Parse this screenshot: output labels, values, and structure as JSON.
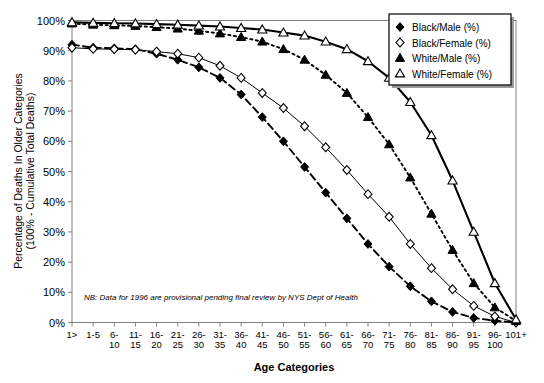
{
  "chart_data": {
    "type": "line",
    "title": "",
    "xlabel": "Age Categories",
    "ylabel": "Percentage of Deaths In Older Categories (100% - Cumulative Total Deaths)",
    "ylabel_line1": "Percentage of Deaths In Older Categories",
    "ylabel_line2": "(100% - Cumulative Total Deaths)",
    "ylim": [
      0,
      100
    ],
    "yticks": [
      0,
      10,
      20,
      30,
      40,
      50,
      60,
      70,
      80,
      90,
      100
    ],
    "ytick_labels": [
      "0%",
      "10%",
      "20%",
      "30%",
      "40%",
      "50%",
      "60%",
      "70%",
      "80%",
      "90%",
      "100%"
    ],
    "grid": false,
    "legend_position": "top-right",
    "annotation": "NB: Data for 1996 are provisional pending final review by NYS Dept of Health",
    "categories": [
      "1>",
      "1-5",
      "6-10",
      "11-15",
      "16-20",
      "21-25",
      "26-30",
      "31-35",
      "36-40",
      "41-45",
      "46-50",
      "51-55",
      "56-60",
      "61-65",
      "66-70",
      "71-75",
      "76-80",
      "81-85",
      "86-90",
      "91-95",
      "96-100",
      "101+"
    ],
    "category_lines": [
      [
        "1>",
        ""
      ],
      [
        "1-5",
        ""
      ],
      [
        "6-",
        "10"
      ],
      [
        "11-",
        "15"
      ],
      [
        "16-",
        "20"
      ],
      [
        "21-",
        "25"
      ],
      [
        "26-",
        "30"
      ],
      [
        "31-",
        "35"
      ],
      [
        "36-",
        "40"
      ],
      [
        "41-",
        "45"
      ],
      [
        "46-",
        "50"
      ],
      [
        "51-",
        "55"
      ],
      [
        "56-",
        "60"
      ],
      [
        "61-",
        "65"
      ],
      [
        "66-",
        "70"
      ],
      [
        "71-",
        "75"
      ],
      [
        "76-",
        "80"
      ],
      [
        "81-",
        "85"
      ],
      [
        "86-",
        "90"
      ],
      [
        "91-",
        "95"
      ],
      [
        "96-",
        "100"
      ],
      [
        "101+",
        ""
      ]
    ],
    "series": [
      {
        "name": "Black/Male (%)",
        "marker": "filled-diamond",
        "line_style": "dashed",
        "color": "#000000",
        "values": [
          92.0,
          91.0,
          90.8,
          90.5,
          89.0,
          87.0,
          84.5,
          81.0,
          75.5,
          68.0,
          60.0,
          51.5,
          43.0,
          34.5,
          26.0,
          18.5,
          12.0,
          7.0,
          3.5,
          1.5,
          0.6,
          0.0
        ]
      },
      {
        "name": "Black/Female (%)",
        "marker": "open-diamond",
        "line_style": "solid-thin",
        "color": "#000000",
        "values": [
          91.0,
          90.6,
          90.5,
          90.3,
          89.7,
          89.0,
          87.7,
          85.0,
          81.0,
          76.0,
          71.0,
          65.0,
          58.0,
          50.5,
          42.5,
          35.0,
          26.0,
          18.0,
          11.0,
          5.5,
          2.0,
          0.0
        ]
      },
      {
        "name": "White/Male (%)",
        "marker": "filled-triangle",
        "line_style": "dotted",
        "color": "#000000",
        "values": [
          99.0,
          98.6,
          98.4,
          98.2,
          97.8,
          97.3,
          96.6,
          95.7,
          94.5,
          93.0,
          90.5,
          87.0,
          82.0,
          76.0,
          68.0,
          59.0,
          48.0,
          36.0,
          24.0,
          13.0,
          5.0,
          0.5
        ]
      },
      {
        "name": "White/Female (%)",
        "marker": "open-triangle",
        "line_style": "solid-thick",
        "color": "#000000",
        "values": [
          99.4,
          99.2,
          99.1,
          99.0,
          98.8,
          98.6,
          98.3,
          98.0,
          97.5,
          97.0,
          96.0,
          95.0,
          93.0,
          90.5,
          86.5,
          81.0,
          73.0,
          62.0,
          47.0,
          30.0,
          13.0,
          1.0
        ]
      }
    ]
  },
  "legend": {
    "items": [
      {
        "label": "Black/Male (%)",
        "marker": "filled-diamond"
      },
      {
        "label": "Black/Female (%)",
        "marker": "open-diamond"
      },
      {
        "label": "White/Male (%)",
        "marker": "filled-triangle"
      },
      {
        "label": "White/Female (%)",
        "marker": "open-triangle"
      }
    ]
  }
}
